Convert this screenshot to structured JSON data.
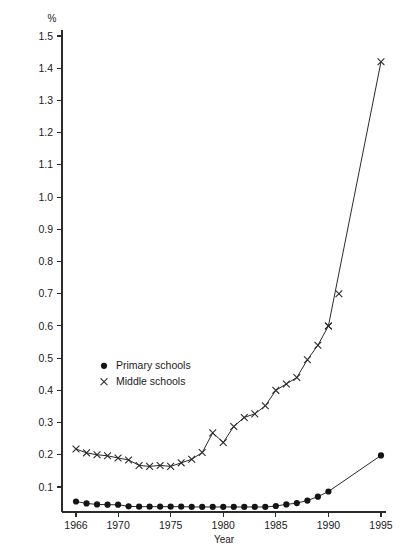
{
  "chart_data": {
    "type": "line",
    "title": "",
    "subtitle": "",
    "unit_label": "%",
    "xlabel": "Year",
    "ylabel": "",
    "xlim": [
      1965.0,
      1996.0
    ],
    "ylim": [
      0.0,
      1.55
    ],
    "grid": false,
    "legend_position": "inside-left-middle",
    "x_ticks": [
      1966,
      1970,
      1975,
      1980,
      1985,
      1990,
      1995
    ],
    "x_tick_labels": [
      "1966",
      "1970",
      "1975",
      "1980",
      "1985",
      "1990",
      "1995"
    ],
    "y_ticks": [
      0.1,
      0.2,
      0.3,
      0.4,
      0.5,
      0.6,
      0.7,
      0.8,
      0.9,
      1.0,
      1.1,
      1.2,
      1.3,
      1.4,
      1.5
    ],
    "y_tick_labels": [
      "0.1",
      "0.2",
      "0.3",
      "0.4",
      "0.5",
      "0.6",
      "0.7",
      "0.8",
      "0.9",
      "1.0",
      "1.1",
      "1.2",
      "1.3",
      "1.4",
      "1.5"
    ],
    "x": [
      1966,
      1967,
      1968,
      1969,
      1970,
      1971,
      1972,
      1973,
      1974,
      1975,
      1976,
      1977,
      1978,
      1979,
      1980,
      1981,
      1982,
      1983,
      1984,
      1985,
      1986,
      1987,
      1988,
      1989,
      1990,
      1995
    ],
    "series": [
      {
        "name": "Primary schools",
        "marker": "circle",
        "values": [
          0.055,
          0.049,
          0.046,
          0.045,
          0.045,
          0.04,
          0.039,
          0.039,
          0.039,
          0.039,
          0.039,
          0.038,
          0.038,
          0.038,
          0.038,
          0.038,
          0.038,
          0.038,
          0.038,
          0.041,
          0.046,
          0.05,
          0.058,
          0.07,
          0.086,
          0.198
        ]
      },
      {
        "name": "Middle schools",
        "marker": "cross",
        "values": [
          0.218,
          0.206,
          0.2,
          0.197,
          0.19,
          0.184,
          0.167,
          0.164,
          0.167,
          0.164,
          0.175,
          0.186,
          0.207,
          0.268,
          0.238,
          0.288,
          0.316,
          0.327,
          0.352,
          0.4,
          0.42,
          0.44,
          0.495,
          0.54,
          0.6,
          1.42
        ]
      }
    ],
    "extra_points": {
      "note": "middle school 1990 segment markers",
      "x": [
        1990,
        1991
      ],
      "values": [
        0.6,
        0.7
      ]
    }
  },
  "legend": {
    "entries": [
      {
        "label": "Primary schools",
        "marker": "circle"
      },
      {
        "label": "Middle schools",
        "marker": "cross"
      }
    ]
  },
  "colors": {
    "line": "#2b2b2b",
    "marker": "#141414",
    "axis": "#2b2b2b",
    "background": "#ffffff"
  }
}
